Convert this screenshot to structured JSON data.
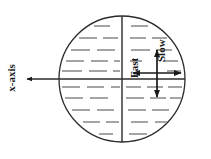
{
  "figure": {
    "type": "schematic-diagram",
    "background_color": "#ffffff",
    "line_color": "#2b2b2b",
    "hatch_color": "#4a4a4a",
    "width": 211,
    "height": 159,
    "circle": {
      "name": "stratified-fluid-cylinder",
      "center_x": 122,
      "center_y": 79,
      "radius": 63,
      "stroke_width": 1.3
    },
    "vertical_diameter": {
      "x": 122,
      "y_top": 16,
      "y_bottom": 142,
      "stroke_width": 1.4
    },
    "horizontal_axis": {
      "y": 79,
      "x_start": 185,
      "x_end": 25,
      "stroke_width": 1.3,
      "arrow_direction": "left"
    },
    "labels": {
      "x_axis": "x-axis",
      "fast": "Fast",
      "slow": "Slow"
    },
    "label_positions": {
      "x_axis": {
        "x": 15,
        "y": 78,
        "rotation": -90,
        "font_size": 11
      },
      "fast": {
        "x": 134,
        "y": 63,
        "rotation": -90,
        "font_size": 11
      },
      "slow": {
        "x": 161,
        "y": 41,
        "rotation": -90,
        "font_size": 11
      }
    },
    "arrow_cross": {
      "name": "fast-slow-direction-cross",
      "center_x": 157,
      "center_y": 73,
      "horizontal": {
        "x1": 133,
        "x2": 181,
        "y": 73
      },
      "vertical": {
        "y1": 50,
        "y2": 97,
        "x": 157
      },
      "stroke_width": 1.6
    },
    "hatching": {
      "description": "horizontal dashed stratification lines filling the circle",
      "rows": [
        {
          "y": 26,
          "segments": [
            [
              94,
              110
            ],
            [
              131,
              148
            ]
          ]
        },
        {
          "y": 38,
          "segments": [
            [
              79,
              97
            ],
            [
              103,
              118
            ],
            [
              130,
              146
            ],
            [
              152,
              167
            ]
          ]
        },
        {
          "y": 50,
          "segments": [
            [
              71,
              90
            ],
            [
              97,
              115
            ],
            [
              131,
              150
            ],
            [
              156,
              172
            ]
          ]
        },
        {
          "y": 61,
          "segments": [
            [
              66,
              84
            ],
            [
              91,
              108
            ],
            [
              114,
              120
            ],
            [
              130,
              142
            ],
            [
              163,
              178
            ]
          ]
        },
        {
          "y": 71,
          "segments": [
            [
              62,
              82
            ],
            [
              89,
              107
            ],
            [
              113,
              120
            ],
            [
              167,
              181
            ]
          ]
        },
        {
          "y": 87,
          "segments": [
            [
              62,
              80
            ],
            [
              87,
              104
            ],
            [
              111,
              120
            ],
            [
              126,
              141
            ],
            [
              147,
              163
            ],
            [
              168,
              182
            ]
          ]
        },
        {
          "y": 98,
          "segments": [
            [
              65,
              83
            ],
            [
              90,
              108
            ],
            [
              126,
              144
            ],
            [
              150,
              166
            ],
            [
              170,
              181
            ]
          ]
        },
        {
          "y": 110,
          "segments": [
            [
              72,
              90
            ],
            [
              97,
              114
            ],
            [
              128,
              146
            ],
            [
              152,
              169
            ]
          ]
        },
        {
          "y": 122,
          "segments": [
            [
              83,
              100
            ],
            [
              106,
              119
            ],
            [
              131,
              148
            ],
            [
              155,
              168
            ]
          ]
        },
        {
          "y": 134,
          "segments": [
            [
              99,
              113
            ],
            [
              129,
              147
            ]
          ]
        }
      ]
    }
  }
}
